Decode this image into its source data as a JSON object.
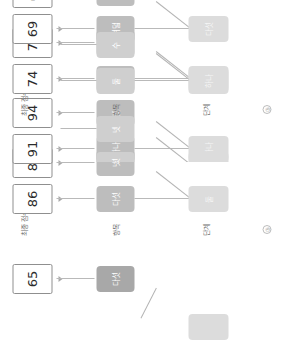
{
  "diagram": {
    "title": "",
    "orientation": "rotated-90-ccw",
    "row_labels": {
      "scores": "최종\n점수",
      "mid": "항목",
      "base": "단계",
      "foot": "③"
    },
    "clusters": [
      {
        "id": "cluster-a",
        "foot_mark": "",
        "row_labels": {
          "scores": "",
          "mid": "",
          "base": "",
          "foot": ""
        },
        "scores": [
          {
            "label": "65"
          }
        ],
        "mid_nodes": [
          {
            "label": "다섯",
            "tone": "dark"
          }
        ],
        "base_nodes": [
          {
            "label": "",
            "tone": "faint"
          }
        ],
        "ghost_nodes": [
          {
            "label": "여섯"
          }
        ]
      },
      {
        "id": "cluster-b",
        "foot_mark": "③",
        "row_labels": {
          "scores": "최종\n점수",
          "mid": "항목",
          "base": "단계",
          "foot": "③"
        },
        "scores": [
          {
            "label": "86"
          },
          {
            "label": "82"
          },
          {
            "label": "91"
          },
          {
            "label": "94"
          }
        ],
        "mid_nodes": [
          {
            "label": "다섯",
            "tone": "normal"
          },
          {
            "label": "넷",
            "tone": "normal"
          },
          {
            "label": "하나",
            "tone": "normal"
          },
          {
            "label": "셋",
            "tone": "normal"
          }
        ],
        "base_nodes": [
          {
            "label": "둘",
            "tone": "faint"
          },
          {
            "label": "하나",
            "tone": "faint"
          }
        ],
        "ghost_nodes": [
          {
            "label": "여섯"
          },
          {
            "label": "넷"
          },
          {
            "label": "둘"
          },
          {
            "label": "수"
          }
        ]
      },
      {
        "id": "cluster-c",
        "foot_mark": "③",
        "row_labels": {
          "scores": "최종\n점수",
          "mid": "항목",
          "base": "단계",
          "foot": "③"
        },
        "scores": [
          {
            "label": "74"
          },
          {
            "label": "78"
          },
          {
            "label": "69"
          },
          {
            "label": "62"
          }
        ],
        "mid_nodes": [
          {
            "label": "셋",
            "tone": "normal"
          },
          {
            "label": "여섯",
            "tone": "normal"
          },
          {
            "label": "여덟",
            "tone": "normal"
          },
          {
            "label": "넷",
            "tone": "normal"
          }
        ],
        "base_nodes": [
          {
            "label": "여섯",
            "tone": "faint"
          },
          {
            "label": "다섯",
            "tone": "faint"
          }
        ],
        "ghost_nodes": [
          {
            "label": "여섯"
          },
          {
            "label": "셋",
            "tone": "normal"
          },
          {
            "label": "넷",
            "tone": "normal"
          },
          {
            "label": "다섯"
          }
        ]
      }
    ],
    "colors": {
      "node_mid": "#bdbdbd",
      "node_mid_dark": "#a8a8a8",
      "node_base": "#d0d0d0",
      "node_base_faint": "#dcdcdc",
      "score_border": "#8f8f8f",
      "link": "#b4b4b4",
      "text_dark": "#3d3d3d",
      "text_light": "#ffffff",
      "background": "#ffffff"
    }
  }
}
